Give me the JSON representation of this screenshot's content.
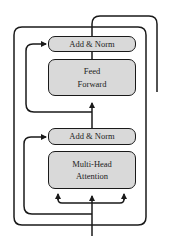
{
  "diagram": {
    "type": "transformer-encoder-block",
    "blocks": [
      {
        "id": "add-norm-top",
        "lines": [
          "Add & Norm"
        ]
      },
      {
        "id": "feed-forward",
        "lines": [
          "Feed",
          "Forward"
        ]
      },
      {
        "id": "add-norm-bottom",
        "lines": [
          "Add & Norm"
        ]
      },
      {
        "id": "multi-head-attention",
        "lines": [
          "Multi-Head",
          "Attention"
        ]
      }
    ],
    "colors": {
      "box_fill": "#d9d9d9",
      "stroke": "#1a1a1a",
      "background": "#ffffff"
    }
  }
}
